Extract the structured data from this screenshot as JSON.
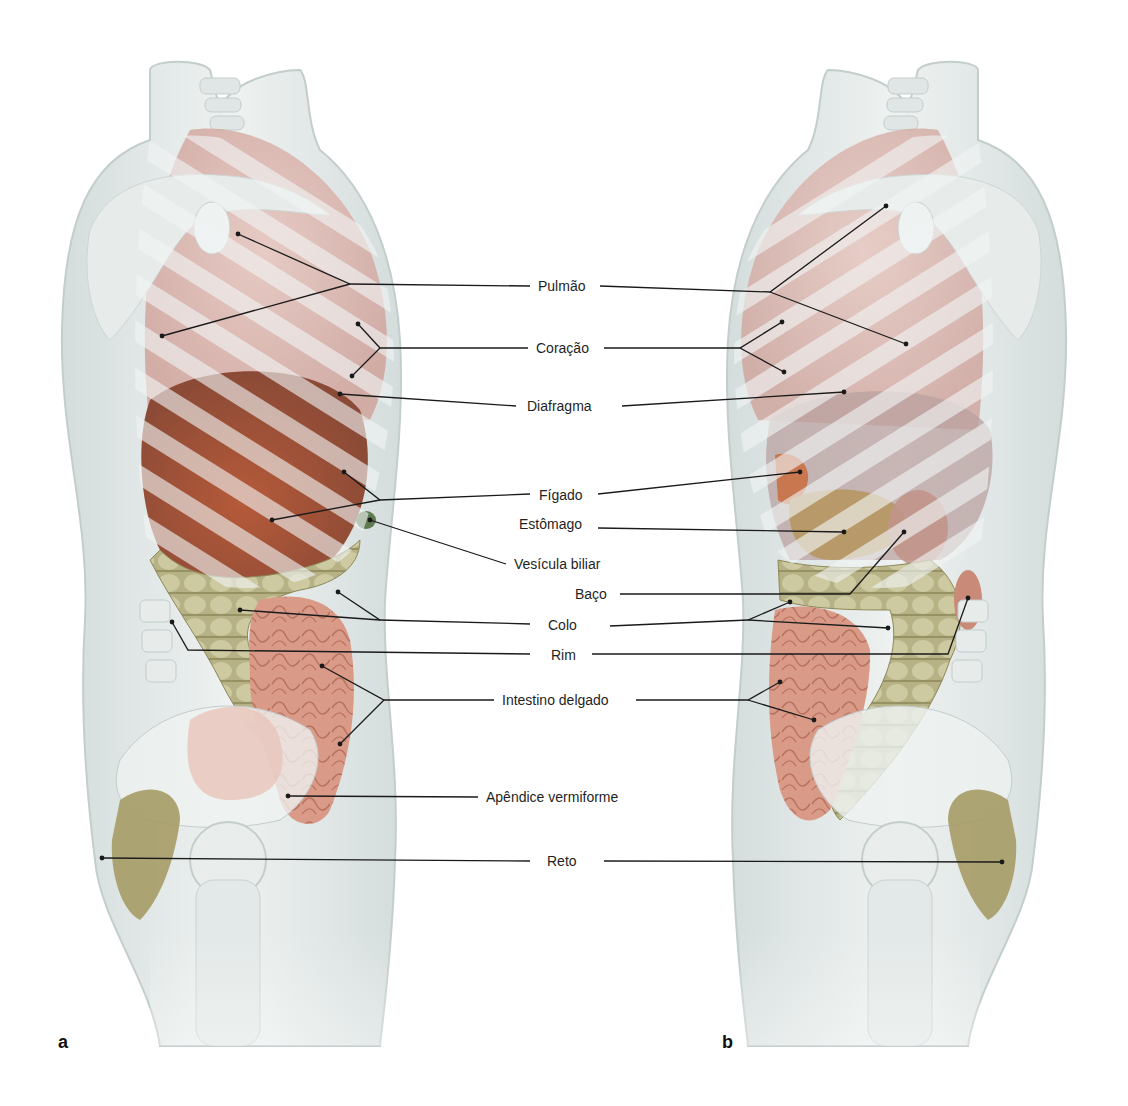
{
  "figure": {
    "panels": [
      {
        "id": "a",
        "letter": "a",
        "letter_pos": [
          58,
          1046
        ],
        "view": "right lateral view of trunk"
      },
      {
        "id": "b",
        "letter": "b",
        "letter_pos": [
          722,
          1046
        ],
        "view": "left lateral view of trunk"
      }
    ],
    "colors": {
      "body": "#e6eceb",
      "body_edge": "#c9d3d2",
      "bone": "#dfe6e5",
      "lung": "#d9b3ad",
      "liver": "#a5533a",
      "liver_light": "#c9876c",
      "colon": "#b9b488",
      "colon_dark": "#8f8a5a",
      "small_intestine": "#dea493",
      "stomach": "#b89a6a",
      "spleen": "#c98a78",
      "rectum": "#9c9160",
      "line": "#1a1a1a"
    },
    "labels": [
      {
        "key": "pulmao",
        "text": "Pulmão",
        "x": 536,
        "y": 278
      },
      {
        "key": "coracao",
        "text": "Coração",
        "x": 534,
        "y": 340
      },
      {
        "key": "diafragma",
        "text": "Diafragma",
        "x": 525,
        "y": 398
      },
      {
        "key": "figado",
        "text": "Fígado",
        "x": 537,
        "y": 487
      },
      {
        "key": "estomago",
        "text": "Estômago",
        "x": 517,
        "y": 516
      },
      {
        "key": "vesicula_biliar",
        "text": "Vesícula biliar",
        "x": 512,
        "y": 556
      },
      {
        "key": "baco",
        "text": "Baço",
        "x": 573,
        "y": 586
      },
      {
        "key": "colo",
        "text": "Colo",
        "x": 546,
        "y": 617
      },
      {
        "key": "rim",
        "text": "Rim",
        "x": 549,
        "y": 647
      },
      {
        "key": "intestino_delgado",
        "text": "Intestino delgado",
        "x": 500,
        "y": 692
      },
      {
        "key": "apendice_vermiforme",
        "text": "Apêndice vermiforme",
        "x": 484,
        "y": 789
      },
      {
        "key": "reto",
        "text": "Reto",
        "x": 545,
        "y": 853
      }
    ],
    "leader_lines": [
      {
        "label": "pulmao",
        "side": "a",
        "points": [
          [
            530,
            286
          ],
          [
            350,
            284
          ],
          [
            238,
            234
          ]
        ]
      },
      {
        "label": "pulmao",
        "side": "a",
        "points": [
          [
            350,
            284
          ],
          [
            162,
            336
          ]
        ]
      },
      {
        "label": "pulmao",
        "side": "b",
        "points": [
          [
            600,
            286
          ],
          [
            770,
            292
          ],
          [
            886,
            206
          ]
        ]
      },
      {
        "label": "pulmao",
        "side": "b",
        "points": [
          [
            770,
            292
          ],
          [
            906,
            344
          ]
        ]
      },
      {
        "label": "coracao",
        "side": "a",
        "points": [
          [
            528,
            348
          ],
          [
            380,
            348
          ],
          [
            358,
            324
          ]
        ]
      },
      {
        "label": "coracao",
        "side": "a",
        "points": [
          [
            380,
            348
          ],
          [
            352,
            376
          ]
        ]
      },
      {
        "label": "coracao",
        "side": "b",
        "points": [
          [
            604,
            348
          ],
          [
            740,
            348
          ],
          [
            782,
            322
          ]
        ]
      },
      {
        "label": "coracao",
        "side": "b",
        "points": [
          [
            740,
            348
          ],
          [
            784,
            372
          ]
        ]
      },
      {
        "label": "diafragma",
        "side": "a",
        "points": [
          [
            516,
            406
          ],
          [
            340,
            394
          ]
        ]
      },
      {
        "label": "diafragma",
        "side": "b",
        "points": [
          [
            622,
            406
          ],
          [
            844,
            392
          ]
        ]
      },
      {
        "label": "figado",
        "side": "a",
        "points": [
          [
            530,
            494
          ],
          [
            380,
            500
          ],
          [
            344,
            472
          ]
        ]
      },
      {
        "label": "figado",
        "side": "a",
        "points": [
          [
            380,
            500
          ],
          [
            272,
            520
          ]
        ]
      },
      {
        "label": "figado",
        "side": "b",
        "points": [
          [
            598,
            494
          ],
          [
            800,
            472
          ]
        ]
      },
      {
        "label": "estomago",
        "side": "b",
        "points": [
          [
            598,
            528
          ],
          [
            844,
            532
          ]
        ]
      },
      {
        "label": "vesicula_biliar",
        "side": "a",
        "points": [
          [
            506,
            564
          ],
          [
            370,
            520
          ]
        ]
      },
      {
        "label": "baco",
        "side": "b",
        "points": [
          [
            620,
            594
          ],
          [
            850,
            594
          ],
          [
            904,
            532
          ]
        ]
      },
      {
        "label": "colo",
        "side": "a",
        "points": [
          [
            530,
            624
          ],
          [
            380,
            620
          ],
          [
            338,
            592
          ]
        ]
      },
      {
        "label": "colo",
        "side": "a",
        "points": [
          [
            380,
            620
          ],
          [
            240,
            610
          ]
        ]
      },
      {
        "label": "colo",
        "side": "b",
        "points": [
          [
            610,
            626
          ],
          [
            748,
            620
          ],
          [
            790,
            602
          ]
        ]
      },
      {
        "label": "colo",
        "side": "b",
        "points": [
          [
            748,
            620
          ],
          [
            888,
            628
          ]
        ]
      },
      {
        "label": "rim",
        "side": "a",
        "points": [
          [
            530,
            654
          ],
          [
            188,
            650
          ],
          [
            172,
            622
          ]
        ]
      },
      {
        "label": "rim",
        "side": "b",
        "points": [
          [
            592,
            654
          ],
          [
            948,
            654
          ],
          [
            968,
            598
          ]
        ]
      },
      {
        "label": "intestino_delgado",
        "side": "a",
        "points": [
          [
            494,
            700
          ],
          [
            384,
            700
          ],
          [
            322,
            666
          ]
        ]
      },
      {
        "label": "intestino_delgado",
        "side": "a",
        "points": [
          [
            384,
            700
          ],
          [
            340,
            744
          ]
        ]
      },
      {
        "label": "intestino_delgado",
        "side": "b",
        "points": [
          [
            636,
            700
          ],
          [
            748,
            700
          ],
          [
            780,
            682
          ]
        ]
      },
      {
        "label": "intestino_delgado",
        "side": "b",
        "points": [
          [
            748,
            700
          ],
          [
            814,
            720
          ]
        ]
      },
      {
        "label": "apendice_vermiforme",
        "side": "a",
        "points": [
          [
            478,
            797
          ],
          [
            288,
            796
          ]
        ]
      },
      {
        "label": "reto",
        "side": "a",
        "points": [
          [
            530,
            861
          ],
          [
            102,
            858
          ]
        ]
      },
      {
        "label": "reto",
        "side": "b",
        "points": [
          [
            604,
            861
          ],
          [
            1002,
            862
          ]
        ]
      }
    ]
  }
}
